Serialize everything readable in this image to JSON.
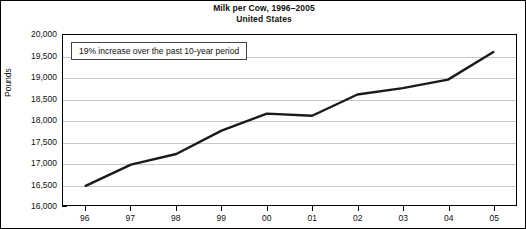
{
  "chart_data": {
    "type": "line",
    "title": "Milk per Cow, 1996–2005",
    "subtitle": "United States",
    "xlabel": "",
    "ylabel": "Pounds",
    "categories": [
      "96",
      "97",
      "98",
      "99",
      "00",
      "01",
      "02",
      "03",
      "04",
      "05"
    ],
    "values": [
      16450,
      16950,
      17200,
      17750,
      18150,
      18100,
      18600,
      18750,
      18950,
      19600
    ],
    "series": [
      {
        "name": "Milk per Cow",
        "values": [
          16450,
          16950,
          17200,
          17750,
          18150,
          18100,
          18600,
          18750,
          18950,
          19600
        ]
      }
    ],
    "ylim": [
      16000,
      20000
    ],
    "ytick_values": [
      20000,
      19500,
      19000,
      18500,
      18000,
      17500,
      17000,
      16500,
      16000
    ],
    "ytick_labels": [
      "20,000",
      "19,500",
      "19,000",
      "18,500",
      "18,000",
      "17,500",
      "17,000",
      "16,500",
      "16,000"
    ],
    "grid": true,
    "legend": "none",
    "line_color": "#1a1a1a",
    "grid_color": "#c8c8c8",
    "axis_color": "#000000",
    "background_color": "#ffffff",
    "annotations": [
      {
        "text": "19% increase over the past 10-year period",
        "position": "top-left"
      }
    ]
  }
}
